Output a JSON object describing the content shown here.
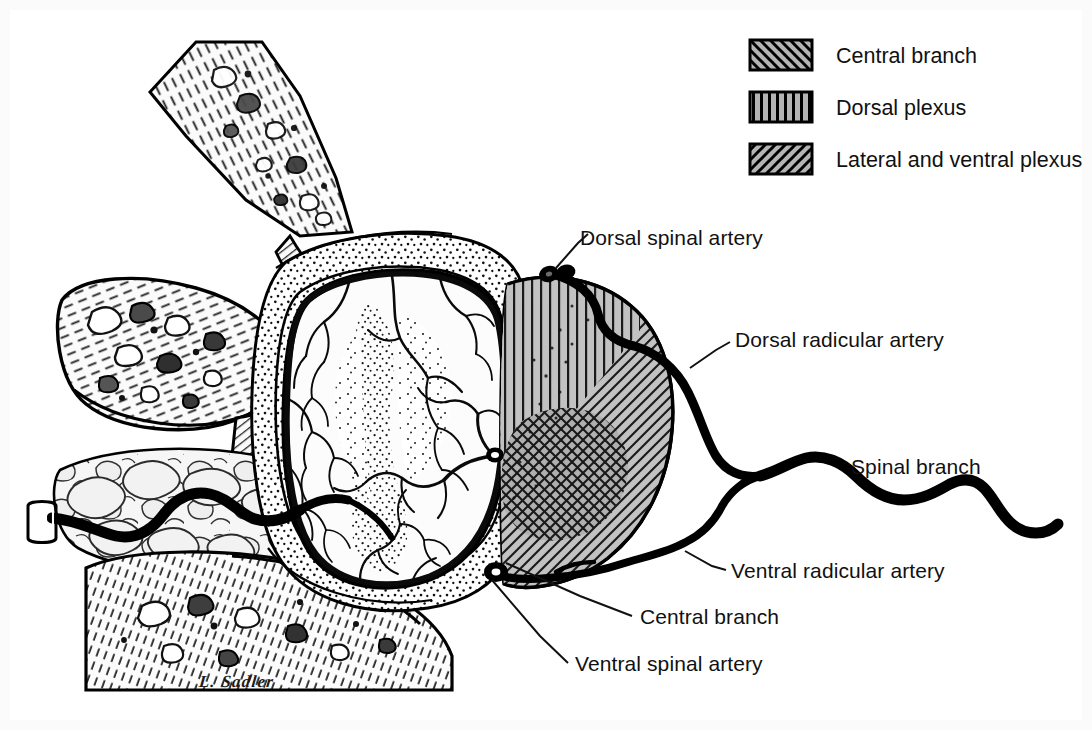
{
  "figure": {
    "signature": "L. Sadler",
    "background_color": "#ffffff",
    "ink_color": "#000000",
    "hatch_fill_color": "#b4b4b4"
  },
  "legend": {
    "position": "top-right",
    "items": [
      {
        "label": "Central branch",
        "pattern": "diagonal-backslash",
        "swatch_fill": "#b4b4b4"
      },
      {
        "label": "Dorsal plexus",
        "pattern": "vertical-lines",
        "swatch_fill": "#b4b4b4"
      },
      {
        "label": "Lateral and ventral plexus",
        "pattern": "diagonal-slash",
        "swatch_fill": "#b4b4b4"
      }
    ]
  },
  "callouts": [
    {
      "id": "dorsal-spinal-artery",
      "label": "Dorsal spinal artery",
      "x": 580,
      "y": 238,
      "anchor_x": 556,
      "anchor_y": 272
    },
    {
      "id": "dorsal-radicular-artery",
      "label": "Dorsal radicular artery",
      "x": 735,
      "y": 340,
      "anchor_x": 690,
      "anchor_y": 366
    },
    {
      "id": "spinal-branch",
      "label": "Spinal branch",
      "x": 851,
      "y": 468,
      "anchor_x": 851,
      "anchor_y": 468
    },
    {
      "id": "ventral-radicular-artery",
      "label": "Ventral radicular artery",
      "x": 731,
      "y": 572,
      "anchor_x": 690,
      "anchor_y": 560
    },
    {
      "id": "central-branch",
      "label": "Central branch",
      "x": 640,
      "y": 618,
      "anchor_x": 505,
      "anchor_y": 560
    },
    {
      "id": "ventral-spinal-artery",
      "label": "Ventral spinal artery",
      "x": 575,
      "y": 665,
      "anchor_x": 492,
      "anchor_y": 578
    }
  ],
  "anatomy": {
    "regions": [
      {
        "name": "vertebral-bone-superior",
        "description": "hatched trabecular bone, upper left"
      },
      {
        "name": "vertebral-bone-body",
        "description": "hatched trabecular bone, mid left"
      },
      {
        "name": "epidural-fat",
        "description": "lobulated adipose tissue, lower left"
      },
      {
        "name": "dura-mater",
        "description": "stippled sheath around cord"
      },
      {
        "name": "spinal-cord",
        "description": "central oval cross-section with pial vessels"
      },
      {
        "name": "gray-matter",
        "description": "stippled butterfly of gray matter"
      },
      {
        "name": "nerve-root-territory",
        "description": "hatched circular territory map right of cord"
      }
    ],
    "arteries": [
      {
        "name": "dorsal-spinal-artery"
      },
      {
        "name": "ventral-spinal-artery"
      },
      {
        "name": "dorsal-radicular-artery"
      },
      {
        "name": "ventral-radicular-artery"
      },
      {
        "name": "spinal-branch"
      },
      {
        "name": "segmental-artery-stub"
      }
    ]
  }
}
